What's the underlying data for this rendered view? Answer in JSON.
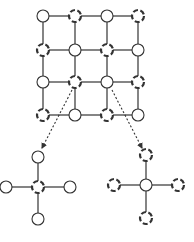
{
  "diagram": {
    "type": "grid-graph-with-neighborhood-callouts",
    "colors": {
      "stroke": "#333333",
      "fill": "#ffffff",
      "arrow": "#333333"
    },
    "node_radius": 6,
    "grid": {
      "rows": 4,
      "cols": 4,
      "xs": [
        43,
        75,
        107,
        138
      ],
      "ys": [
        16,
        50,
        82,
        115
      ],
      "node_styles": [
        [
          "solid",
          "dashed",
          "solid",
          "dashed"
        ],
        [
          "dashed",
          "solid",
          "dashed",
          "solid"
        ],
        [
          "solid",
          "dashed",
          "solid",
          "dashed"
        ],
        [
          "dashed",
          "solid",
          "dashed",
          "solid"
        ]
      ]
    },
    "callouts": [
      {
        "name": "dashed-center-neighborhood",
        "source_node": [
          2,
          1
        ],
        "arrow": {
          "from": [
            72,
            90
          ],
          "to": [
            42,
            148
          ]
        },
        "center": {
          "x": 38,
          "y": 187,
          "style": "dashed"
        },
        "neighbors": [
          {
            "x": 38,
            "y": 157,
            "style": "solid"
          },
          {
            "x": 6,
            "y": 187,
            "style": "solid"
          },
          {
            "x": 70,
            "y": 187,
            "style": "solid"
          },
          {
            "x": 38,
            "y": 219,
            "style": "solid"
          }
        ]
      },
      {
        "name": "solid-center-neighborhood",
        "source_node": [
          2,
          2
        ],
        "arrow": {
          "from": [
            112,
            90
          ],
          "to": [
            142,
            148
          ]
        },
        "center": {
          "x": 146,
          "y": 185,
          "style": "solid"
        },
        "neighbors": [
          {
            "x": 146,
            "y": 155,
            "style": "dashed"
          },
          {
            "x": 114,
            "y": 185,
            "style": "dashed"
          },
          {
            "x": 178,
            "y": 185,
            "style": "dashed"
          },
          {
            "x": 146,
            "y": 218,
            "style": "dashed"
          }
        ]
      }
    ]
  }
}
